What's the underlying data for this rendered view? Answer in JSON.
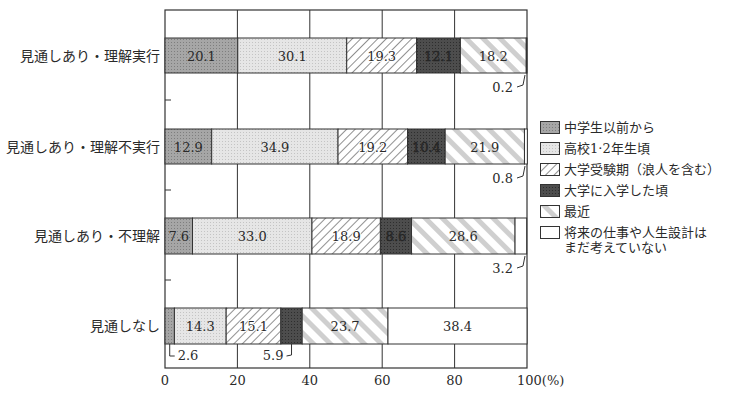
{
  "chart_data": {
    "type": "bar",
    "orientation": "horizontal",
    "stacked": true,
    "title": "",
    "xlabel": "(%)",
    "ylabel": "",
    "xlim": [
      0,
      100
    ],
    "xticks": [
      0,
      20,
      40,
      60,
      80,
      100
    ],
    "xtick_labels": [
      "0",
      "20",
      "40",
      "60",
      "80",
      "100(%)"
    ],
    "grid": true,
    "legend_position": "right",
    "categories": [
      "見通しあり・理解実行",
      "見通しあり・理解不実行",
      "見通しあり・不理解",
      "見通しなし"
    ],
    "series": [
      {
        "name": "中学生以前から",
        "pattern": "dark-gray-dots",
        "color": "#9a9a9a",
        "values": [
          20.1,
          12.9,
          7.6,
          2.6
        ]
      },
      {
        "name": "高校1·2年生頃",
        "pattern": "light-gray-dots",
        "color": "#dcdcdc",
        "values": [
          30.1,
          34.9,
          33.0,
          14.3
        ]
      },
      {
        "name": "大学受験期（浪人を含む）",
        "pattern": "diagonal-hatch",
        "color": "#ffffff",
        "values": [
          19.3,
          19.2,
          18.9,
          15.1
        ]
      },
      {
        "name": "大学に入学した頃",
        "pattern": "dark-fill",
        "color": "#4a4a4a",
        "values": [
          12.1,
          10.4,
          8.6,
          5.9
        ]
      },
      {
        "name": "最近",
        "pattern": "wide-diagonal-stripes",
        "color": "#d0d0d0",
        "values": [
          18.2,
          21.9,
          28.6,
          23.7
        ]
      },
      {
        "name": "将来の仕事や人生設計は\nまだ考えていない",
        "pattern": "blank",
        "color": "#ffffff",
        "values": [
          0.2,
          0.8,
          3.2,
          38.4
        ]
      }
    ],
    "annotations": [
      {
        "category": "見通しあり・理解実行",
        "text": "0.2",
        "callout": "below-right"
      },
      {
        "category": "見通しあり・理解不実行",
        "text": "0.8",
        "callout": "below-right"
      },
      {
        "category": "見通しあり・不理解",
        "text": "3.2",
        "callout": "below-right"
      },
      {
        "category": "見通しなし",
        "text": "2.6",
        "callout": "below-left"
      },
      {
        "category": "見通しなし",
        "text": "5.9",
        "callout": "below"
      }
    ]
  },
  "legend": {
    "items": [
      {
        "label": "中学生以前から"
      },
      {
        "label": "高校1·2年生頃"
      },
      {
        "label": "大学受験期（浪人を含む）"
      },
      {
        "label": "大学に入学した頃"
      },
      {
        "label": "最近"
      },
      {
        "label": "将来の仕事や人生設計は\nまだ考えていない"
      }
    ]
  }
}
